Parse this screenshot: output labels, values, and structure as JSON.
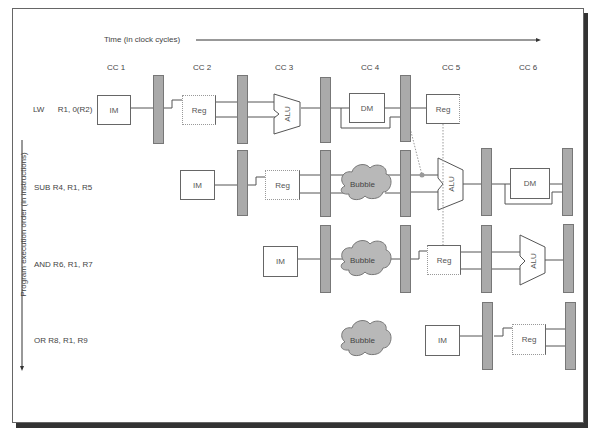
{
  "diagram": {
    "time_axis_label": "Time (in clock cycles)",
    "order_axis_label": "Program execution order (in instructions)",
    "clock_cycles": [
      "CC 1",
      "CC 2",
      "CC 3",
      "CC 4",
      "CC 5",
      "CC 6"
    ],
    "instructions": [
      {
        "label": "LW      R1, 0(R2)",
        "stages": [
          "IM",
          "Reg",
          "ALU",
          "DM",
          "Reg"
        ]
      },
      {
        "label": "SUB R4, R1, R5",
        "stages": [
          "IM",
          "Reg",
          "Bubble",
          "ALU",
          "DM"
        ]
      },
      {
        "label": "AND R6, R1, R7",
        "stages": [
          "IM",
          "Bubble",
          "Reg",
          "ALU"
        ]
      },
      {
        "label": "OR R8, R1, R9",
        "stages": [
          "Bubble",
          "IM",
          "Reg"
        ]
      }
    ],
    "stage_labels": {
      "im": "IM",
      "reg": "Reg",
      "alu": "ALU",
      "dm": "DM",
      "bubble": "Bubble"
    },
    "colors": {
      "latch": "#aaaaaa",
      "bubble": "#b8b8b8",
      "line": "#555555",
      "forward_dot": "#999999"
    }
  }
}
